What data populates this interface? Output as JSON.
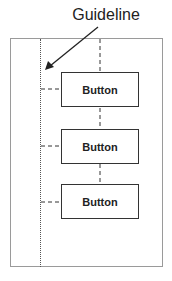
{
  "annotation": {
    "label": "Guideline"
  },
  "buttons": [
    {
      "label": "Button"
    },
    {
      "label": "Button"
    },
    {
      "label": "Button"
    }
  ],
  "colors": {
    "frame": "#9a9a9a",
    "button_border": "#333333",
    "text": "#222222"
  }
}
